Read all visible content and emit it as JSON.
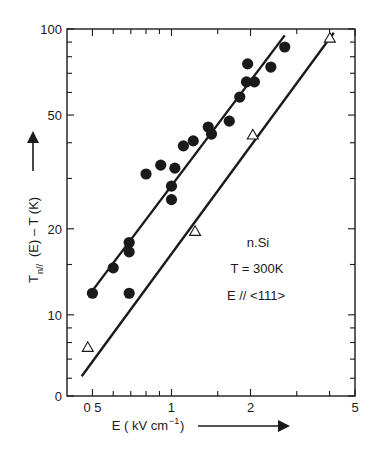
{
  "chart_data": {
    "type": "scatter",
    "title": "",
    "xlabel": "E ( kV cm⁻¹ )",
    "ylabel": "T n// (E) - T (K)",
    "ylabel_parts": {
      "main": "T",
      "sub": "n//",
      "rest": "(E) – T (K)"
    },
    "xlabel_parts": {
      "main": "E  ( kV cm",
      "sup": "−1",
      "rest": " )"
    },
    "xscale": "log",
    "yscale": "log",
    "xlim": [
      0.4,
      5
    ],
    "ylim": [
      5.2,
      100
    ],
    "grid": false,
    "x_ticks": [
      {
        "value": 0.5,
        "label": "0 5"
      },
      {
        "value": 0.6,
        "label": ""
      },
      {
        "value": 0.7,
        "label": ""
      },
      {
        "value": 0.8,
        "label": ""
      },
      {
        "value": 0.9,
        "label": ""
      },
      {
        "value": 1,
        "label": "1"
      },
      {
        "value": 1.5,
        "label": ""
      },
      {
        "value": 2,
        "label": "2"
      },
      {
        "value": 3,
        "label": ""
      },
      {
        "value": 4,
        "label": ""
      },
      {
        "value": 5,
        "label": "5"
      }
    ],
    "y_ticks": [
      {
        "value": 5.2,
        "label": "0"
      },
      {
        "value": 6,
        "label": ""
      },
      {
        "value": 7,
        "label": ""
      },
      {
        "value": 8,
        "label": ""
      },
      {
        "value": 9,
        "label": ""
      },
      {
        "value": 10,
        "label": "10"
      },
      {
        "value": 15,
        "label": ""
      },
      {
        "value": 20,
        "label": "20"
      },
      {
        "value": 30,
        "label": ""
      },
      {
        "value": 40,
        "label": ""
      },
      {
        "value": 50,
        "label": "50"
      },
      {
        "value": 60,
        "label": ""
      },
      {
        "value": 70,
        "label": ""
      },
      {
        "value": 80,
        "label": ""
      },
      {
        "value": 90,
        "label": ""
      },
      {
        "value": 100,
        "label": "100"
      }
    ],
    "series": [
      {
        "name": "filled-circles",
        "marker": "filled-circle",
        "points": [
          {
            "x": 0.5,
            "y": 11.9
          },
          {
            "x": 0.6,
            "y": 14.6
          },
          {
            "x": 0.69,
            "y": 11.9
          },
          {
            "x": 0.69,
            "y": 17.9
          },
          {
            "x": 0.69,
            "y": 16.6
          },
          {
            "x": 0.8,
            "y": 31.1
          },
          {
            "x": 0.91,
            "y": 33.4
          },
          {
            "x": 1.0,
            "y": 28.2
          },
          {
            "x": 1.0,
            "y": 25.3
          },
          {
            "x": 1.03,
            "y": 32.6
          },
          {
            "x": 1.11,
            "y": 39.0
          },
          {
            "x": 1.21,
            "y": 40.6
          },
          {
            "x": 1.38,
            "y": 45.4
          },
          {
            "x": 1.42,
            "y": 42.9
          },
          {
            "x": 1.66,
            "y": 47.6
          },
          {
            "x": 1.82,
            "y": 57.8
          },
          {
            "x": 1.93,
            "y": 65.3
          },
          {
            "x": 1.95,
            "y": 75.5
          },
          {
            "x": 2.07,
            "y": 65.3
          },
          {
            "x": 2.39,
            "y": 73.6
          },
          {
            "x": 2.7,
            "y": 86.5
          }
        ],
        "fit_line": [
          {
            "x": 0.505,
            "y": 12.3
          },
          {
            "x": 2.7,
            "y": 95
          }
        ]
      },
      {
        "name": "open-triangles",
        "marker": "open-triangle",
        "points": [
          {
            "x": 0.48,
            "y": 7.7
          },
          {
            "x": 1.23,
            "y": 19.6
          },
          {
            "x": 2.04,
            "y": 42.6
          },
          {
            "x": 4.01,
            "y": 93
          }
        ],
        "fit_line": [
          {
            "x": 0.455,
            "y": 6.1
          },
          {
            "x": 4.15,
            "y": 97
          }
        ]
      }
    ],
    "annotations": [
      "n.Si",
      "T = 300K",
      "E // <111>"
    ],
    "legend": "none"
  }
}
